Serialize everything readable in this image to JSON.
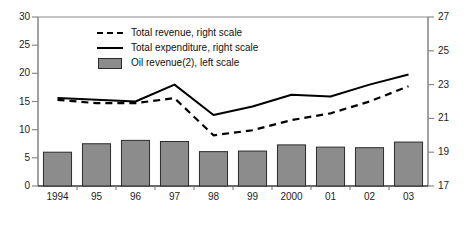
{
  "chart_data": {
    "type": "bar",
    "title": "",
    "subtitle": "",
    "xlabel": "",
    "ylabel": "",
    "grid": false,
    "legend_position": "top-center",
    "categories": [
      "1994",
      "95",
      "96",
      "97",
      "98",
      "99",
      "2000",
      "01",
      "02",
      "03"
    ],
    "left_axis": {
      "label": "",
      "ylim": [
        0,
        30
      ],
      "ticks": [
        0,
        5,
        10,
        15,
        20,
        25,
        30
      ],
      "tick_labels": [
        "0",
        "5",
        "10",
        "15",
        "20",
        "25",
        "30"
      ]
    },
    "right_axis": {
      "label": "",
      "ylim": [
        17,
        27
      ],
      "ticks": [
        17,
        19,
        21,
        23,
        25,
        27
      ],
      "tick_labels": [
        "17",
        "19",
        "21",
        "23",
        "25",
        "27"
      ]
    },
    "series": [
      {
        "name": "Oil revenue(2), left scale",
        "type": "bar",
        "axis": "left",
        "color": "#8c8c8c",
        "edge_color": "#2b2b2b",
        "values": [
          6.0,
          7.5,
          8.1,
          7.9,
          6.1,
          6.2,
          7.3,
          6.9,
          6.8,
          7.8
        ]
      },
      {
        "name": "Total expenditure, right scale",
        "type": "line",
        "axis": "right",
        "style": "solid",
        "color": "#000000",
        "values": [
          22.2,
          22.1,
          22.0,
          23.0,
          21.2,
          21.7,
          22.4,
          22.3,
          23.0,
          23.6
        ]
      },
      {
        "name": "Total revenue, right scale",
        "type": "line",
        "axis": "right",
        "style": "dashed",
        "color": "#000000",
        "values": [
          22.1,
          21.9,
          21.9,
          22.2,
          20.0,
          20.3,
          20.9,
          21.3,
          22.0,
          22.9
        ]
      }
    ]
  },
  "legend": {
    "items": [
      {
        "label": "Total revenue, right scale",
        "key": "dashed-line-key"
      },
      {
        "label": "Total expenditure, right scale",
        "key": "solid-line-key"
      },
      {
        "label": "Oil revenue(2), left scale",
        "key": "bar-swatch-key"
      }
    ]
  },
  "colors": {
    "bar_fill": "#8c8c8c",
    "bar_edge": "#2b2b2b",
    "line": "#000000",
    "axis": "#808080",
    "background": "#ffffff"
  }
}
